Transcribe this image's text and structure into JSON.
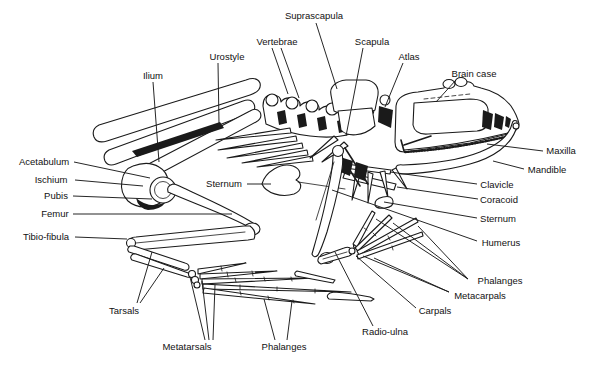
{
  "figure": {
    "background": "#ffffff",
    "ink_color": "#1a1a1a",
    "labels": [
      {
        "id": "suprascapula",
        "text": "Suprascapula",
        "x": 314,
        "y": 16,
        "lines": [
          [
            316,
            23,
            337,
            89
          ]
        ]
      },
      {
        "id": "vertebrae",
        "text": "Vertebrae",
        "x": 277,
        "y": 42,
        "lines": [
          [
            272,
            48,
            288,
            94
          ],
          [
            281,
            48,
            299,
            98
          ]
        ]
      },
      {
        "id": "scapula",
        "text": "Scapula",
        "x": 372,
        "y": 42,
        "lines": [
          [
            363,
            48,
            346,
            136
          ]
        ]
      },
      {
        "id": "atlas",
        "text": "Atlas",
        "x": 409,
        "y": 57,
        "lines": [
          [
            403,
            63,
            385,
            107
          ]
        ]
      },
      {
        "id": "brain-case",
        "text": "Brain case",
        "x": 474,
        "y": 74,
        "lines": [
          [
            456,
            80,
            436,
            102
          ]
        ]
      },
      {
        "id": "urostyle",
        "text": "Urostyle",
        "x": 227,
        "y": 57,
        "lines": [
          [
            218,
            63,
            219,
            124
          ]
        ]
      },
      {
        "id": "ilium",
        "text": "Ilium",
        "x": 153,
        "y": 76,
        "lines": [
          [
            153,
            82,
            159,
            162
          ]
        ]
      },
      {
        "id": "acetabulum",
        "text": "Acetabulum",
        "x": 44,
        "y": 162,
        "lines": [
          [
            74,
            162,
            150,
            178
          ]
        ]
      },
      {
        "id": "ischium",
        "text": "Ischium",
        "x": 51,
        "y": 180,
        "lines": [
          [
            75,
            180,
            143,
            186
          ]
        ]
      },
      {
        "id": "pubis",
        "text": "Pubis",
        "x": 56,
        "y": 196,
        "lines": [
          [
            73,
            196,
            152,
            199
          ]
        ]
      },
      {
        "id": "femur",
        "text": "Femur",
        "x": 55,
        "y": 214,
        "lines": [
          [
            73,
            214,
            232,
            214
          ]
        ]
      },
      {
        "id": "tibio-fibula",
        "text": "Tibio-fibula",
        "x": 46,
        "y": 237,
        "lines": [
          [
            75,
            237,
            127,
            239
          ]
        ]
      },
      {
        "id": "sternum-left",
        "text": "Sternum",
        "x": 224,
        "y": 184,
        "lines": [
          [
            247,
            184,
            271,
            184
          ]
        ]
      },
      {
        "id": "maxilla",
        "text": "Maxilla",
        "x": 561,
        "y": 151,
        "lines": [
          [
            543,
            151,
            487,
            144
          ]
        ]
      },
      {
        "id": "mandible",
        "text": "Mandible",
        "x": 547,
        "y": 170,
        "lines": [
          [
            524,
            169,
            493,
            161
          ]
        ]
      },
      {
        "id": "clavicle",
        "text": "Clavicle",
        "x": 497,
        "y": 185,
        "lines": [
          [
            477,
            184,
            390,
            172
          ]
        ]
      },
      {
        "id": "coracoid",
        "text": "Coracoid",
        "x": 499,
        "y": 200,
        "lines": [
          [
            478,
            199,
            397,
            187
          ]
        ]
      },
      {
        "id": "sternum-right",
        "text": "Sternum",
        "x": 498,
        "y": 219,
        "lines": [
          [
            477,
            218,
            384,
            202
          ]
        ]
      },
      {
        "id": "humerus",
        "text": "Humerus",
        "x": 501,
        "y": 243,
        "lines": [
          [
            477,
            241,
            332,
            190
          ]
        ]
      },
      {
        "id": "phalanges-hand",
        "text": "Phalanges",
        "x": 500,
        "y": 281,
        "lines": [
          [
            468,
            279,
            376,
            219
          ],
          [
            468,
            279,
            393,
            223
          ],
          [
            468,
            279,
            418,
            226
          ]
        ]
      },
      {
        "id": "metacarpals",
        "text": "Metacarpals",
        "x": 480,
        "y": 296,
        "lines": [
          [
            449,
            292,
            363,
            256
          ],
          [
            449,
            292,
            374,
            258
          ]
        ]
      },
      {
        "id": "carpals",
        "text": "Carpals",
        "x": 435,
        "y": 311,
        "lines": [
          [
            416,
            308,
            356,
            256
          ]
        ]
      },
      {
        "id": "radio-ulna",
        "text": "Radio-ulna",
        "x": 385,
        "y": 332,
        "lines": [
          [
            373,
            326,
            335,
            252
          ]
        ]
      },
      {
        "id": "tarsals",
        "text": "Tarsals",
        "x": 124,
        "y": 311,
        "lines": [
          [
            137,
            303,
            152,
            252
          ],
          [
            140,
            303,
            164,
            268
          ]
        ]
      },
      {
        "id": "metatarsals",
        "text": "Metatarsals",
        "x": 187,
        "y": 347,
        "lines": [
          [
            205,
            340,
            190,
            277
          ],
          [
            209,
            340,
            202,
            281
          ],
          [
            213,
            340,
            215,
            285
          ]
        ]
      },
      {
        "id": "phalanges-foot",
        "text": "Phalanges",
        "x": 284,
        "y": 347,
        "lines": [
          [
            275,
            340,
            264,
            299
          ],
          [
            287,
            340,
            292,
            301
          ]
        ]
      }
    ]
  }
}
